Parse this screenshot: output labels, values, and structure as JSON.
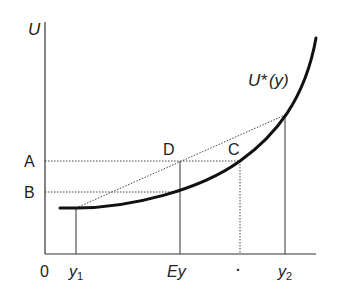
{
  "diagram": {
    "type": "expected-utility-convex",
    "axes": {
      "y_label": "U",
      "origin_label": "0"
    },
    "curve_label": {
      "main": "U*",
      "arg": "(y)"
    },
    "x_ticks": {
      "y1": {
        "base": "y",
        "sub": "1"
      },
      "ey": "Ey",
      "ce": "·",
      "y2": {
        "base": "y",
        "sub": "2"
      }
    },
    "y_ticks": {
      "a": "A",
      "b": "B"
    },
    "points": {
      "d": "D",
      "c": "C"
    },
    "colors": {
      "curve": "#111111",
      "axis": "#333333",
      "guide": "#444444"
    }
  }
}
